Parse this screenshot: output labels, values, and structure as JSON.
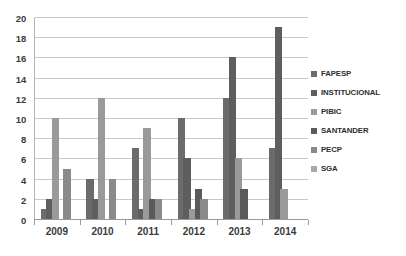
{
  "chart_data": {
    "type": "bar",
    "title": "",
    "subtitle": "",
    "xlabel": "",
    "ylabel": "",
    "categories": [
      "2009",
      "2010",
      "2011",
      "2012",
      "2013",
      "2014"
    ],
    "ylim": [
      0,
      20
    ],
    "y_ticks": [
      0,
      2,
      4,
      6,
      8,
      10,
      12,
      14,
      16,
      18,
      20
    ],
    "y_tick_labels": [
      "0",
      "2",
      "4",
      "6",
      "8",
      "10",
      "12",
      "14",
      "16",
      "18",
      "20"
    ],
    "grid": true,
    "grid_axis": "y",
    "legend_position": "right",
    "series": [
      {
        "name": "FAPESP",
        "color": "#6b6b6b",
        "values": [
          1,
          4,
          7,
          10,
          12,
          7
        ]
      },
      {
        "name": "INSTITUCIONAL",
        "color": "#5e5e5e",
        "values": [
          2,
          2,
          1,
          6,
          16,
          19
        ]
      },
      {
        "name": "PIBIC",
        "color": "#9a9a9a",
        "values": [
          10,
          12,
          9,
          1,
          6,
          3
        ]
      },
      {
        "name": "SANTANDER",
        "color": "#5a5a5a",
        "values": [
          0,
          0,
          2,
          3,
          3,
          0
        ]
      },
      {
        "name": "PECP",
        "color": "#8a8a8a",
        "values": [
          5,
          4,
          2,
          2,
          0,
          0
        ]
      },
      {
        "name": "SGA",
        "color": "#a8a8a8",
        "values": [
          0,
          0,
          0,
          0,
          0,
          0
        ]
      }
    ]
  },
  "legend": {
    "items": [
      {
        "label": "FAPESP"
      },
      {
        "label": "INSTITUCIONAL"
      },
      {
        "label": "PIBIC"
      },
      {
        "label": "SANTANDER"
      },
      {
        "label": "PECP"
      },
      {
        "label": "SGA"
      }
    ]
  },
  "style": {
    "plot_background": "#ffffff",
    "gridline_color": "#c8c8c8",
    "axis_color": "#9a9a9a",
    "tick_label_color": "#3b3b3b"
  }
}
